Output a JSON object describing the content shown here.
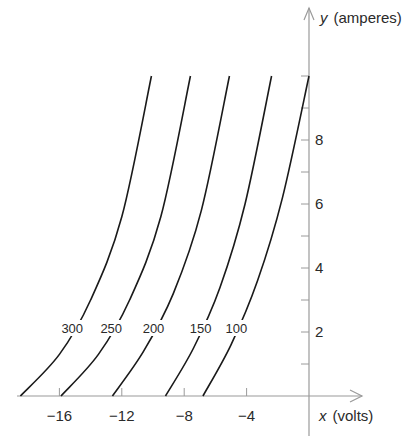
{
  "chart_data": {
    "type": "line",
    "title": "",
    "xlabel": "x (volts)",
    "ylabel": "y (amperes)",
    "xlabel_var": "x",
    "xlabel_unit": "(volts)",
    "ylabel_var": "y",
    "ylabel_unit": "(amperes)",
    "xlim": [
      -19,
      2
    ],
    "ylim": [
      0,
      11
    ],
    "grid": false,
    "x_ticks": [
      -16,
      -12,
      -8,
      -4
    ],
    "x_minor_ticks": [
      -16,
      -12,
      -8,
      -4,
      0
    ],
    "y_ticks": [
      2,
      4,
      6,
      8
    ],
    "y_minor_ticks": [
      1,
      2,
      3,
      4,
      5,
      6,
      7,
      8,
      9,
      10
    ],
    "series": [
      {
        "name": "300",
        "label": "300",
        "x_intercept": -18.5,
        "x_at_y10": -10.1,
        "points": [
          [
            -18.5,
            0
          ],
          [
            -16.0,
            1.3
          ],
          [
            -14.0,
            3.0
          ],
          [
            -12.0,
            5.6
          ],
          [
            -10.1,
            10
          ]
        ]
      },
      {
        "name": "250",
        "label": "250",
        "x_intercept": -15.9,
        "x_at_y10": -7.6,
        "points": [
          [
            -15.9,
            0
          ],
          [
            -13.5,
            1.3
          ],
          [
            -11.5,
            3.0
          ],
          [
            -9.5,
            5.6
          ],
          [
            -7.6,
            10
          ]
        ]
      },
      {
        "name": "200",
        "label": "200",
        "x_intercept": -12.6,
        "x_at_y10": -5.1,
        "points": [
          [
            -12.6,
            0
          ],
          [
            -10.6,
            1.4
          ],
          [
            -8.7,
            3.2
          ],
          [
            -6.9,
            5.8
          ],
          [
            -5.1,
            10
          ]
        ]
      },
      {
        "name": "150",
        "label": "150",
        "x_intercept": -9.2,
        "x_at_y10": -2.4,
        "points": [
          [
            -9.2,
            0
          ],
          [
            -7.4,
            1.5
          ],
          [
            -5.7,
            3.4
          ],
          [
            -4.1,
            6.0
          ],
          [
            -2.4,
            10
          ]
        ]
      },
      {
        "name": "100",
        "label": "100",
        "x_intercept": -6.8,
        "x_at_y10": 0.0,
        "points": [
          [
            -6.8,
            0
          ],
          [
            -5.0,
            1.6
          ],
          [
            -3.3,
            3.6
          ],
          [
            -1.7,
            6.2
          ],
          [
            0.0,
            10
          ]
        ]
      }
    ],
    "annotations": [
      "300",
      "250",
      "200",
      "150",
      "100"
    ],
    "legend": "none (curves labeled inline)"
  },
  "labels": {
    "x_tick_labels": [
      "−16",
      "−12",
      "−8",
      "−4"
    ],
    "y_tick_labels": [
      "2",
      "4",
      "6",
      "8"
    ],
    "curve_labels": [
      "300",
      "250",
      "200",
      "150",
      "100"
    ]
  },
  "colors": {
    "axis": "#9a9a9a",
    "curve": "#1a1a1a",
    "text": "#2a2a2a",
    "background": "#ffffff"
  }
}
